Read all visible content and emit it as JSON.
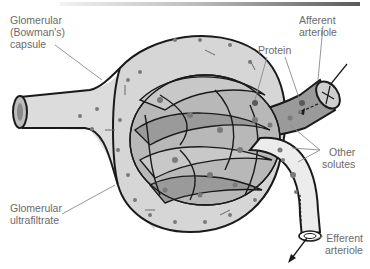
{
  "figure": {
    "colors": {
      "capsule_fill": "#d9d9d9",
      "capillary_fill": "#9a9a9a",
      "capillary_light": "#c4c4c4",
      "efferent_fill": "#e6e6e6",
      "dot": "#7a7a7a",
      "outline": "#1a1a1a",
      "leader_line": "#8a8a8a",
      "label_text": "#6a6a6a"
    }
  },
  "labels": {
    "capsule": "Glomerular\n(Bowman's)\ncapsule",
    "afferent": "Afferent arteriole",
    "protein": "Protein",
    "other_solutes": "Other\nsolutes",
    "ultrafiltrate": "Glomerular\nultrafiltrate",
    "efferent": "Efferent\narteriole"
  }
}
